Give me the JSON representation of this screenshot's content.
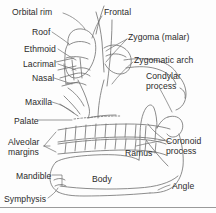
{
  "figure": {
    "background_color": "#fdfdfd",
    "line_color": "#6f6f6f",
    "text_color": "#2b2b2b",
    "baseline_rule_color": "#9a9a9a"
  },
  "labels": [
    {
      "id": "orbital-rim",
      "text": "Orbital rim",
      "x": 12,
      "y": 8
    },
    {
      "id": "frontal",
      "text": "Frontal",
      "x": 104,
      "y": 8
    },
    {
      "id": "roof",
      "text": "Roof",
      "x": 32,
      "y": 28
    },
    {
      "id": "zygoma-malar",
      "text": "Zygoma (malar)",
      "x": 128,
      "y": 33
    },
    {
      "id": "ethmoid",
      "text": "Ethmoid",
      "x": 24,
      "y": 45
    },
    {
      "id": "lacrimal",
      "text": "Lacrimal",
      "x": 23,
      "y": 60
    },
    {
      "id": "zygomatic-arch",
      "text": "Zygomatic arch",
      "x": 134,
      "y": 56
    },
    {
      "id": "nasal",
      "text": "Nasal",
      "x": 32,
      "y": 74
    },
    {
      "id": "condylar-process",
      "text": "Condylar\nprocess",
      "x": 146,
      "y": 71
    },
    {
      "id": "maxilla",
      "text": "Maxilla",
      "x": 25,
      "y": 98
    },
    {
      "id": "palate",
      "text": "Palate",
      "x": 14,
      "y": 117
    },
    {
      "id": "coronoid-process",
      "text": "Coronoid\nprocess",
      "x": 166,
      "y": 136
    },
    {
      "id": "alveolar-margins",
      "text": "Alveolar\nmargins",
      "x": 8,
      "y": 137
    },
    {
      "id": "ramus",
      "text": "Ramus",
      "x": 125,
      "y": 149
    },
    {
      "id": "mandible",
      "text": "Mandible",
      "x": 16,
      "y": 172
    },
    {
      "id": "body",
      "text": "Body",
      "x": 92,
      "y": 175
    },
    {
      "id": "angle",
      "text": "Angle",
      "x": 172,
      "y": 182
    },
    {
      "id": "symphysis",
      "text": "Symphysis",
      "x": 4,
      "y": 195
    }
  ],
  "anatomy_parts": [
    "orbital rim",
    "frontal bone",
    "orbital roof",
    "zygoma (malar)",
    "ethmoid",
    "lacrimal",
    "zygomatic arch",
    "nasal bone",
    "condylar process",
    "maxilla",
    "palate",
    "coronoid process",
    "alveolar margins",
    "ramus",
    "mandible",
    "body",
    "angle",
    "symphysis"
  ]
}
